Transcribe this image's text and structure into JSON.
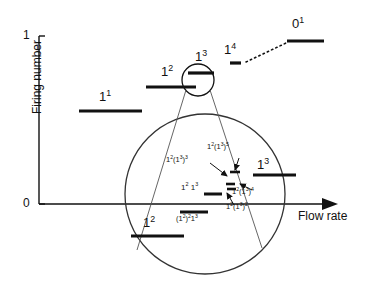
{
  "figure": {
    "type": "devil-staircase-firing-number",
    "axes": {
      "ylabel": "Firing number",
      "xlabel": "Flow rate",
      "yticks": [
        "0",
        "1"
      ],
      "ylim": [
        0,
        1
      ],
      "xticks": [],
      "grid": false
    },
    "plateaus": [
      {
        "label_html": "1<sup>1</sup>",
        "name": "plateau-1-1"
      },
      {
        "label_html": "1<sup>2</sup>",
        "name": "plateau-1-2-upper"
      },
      {
        "label_html": "1<sup>3</sup>",
        "name": "plateau-1-3-upper"
      },
      {
        "label_html": "1<sup>4</sup>",
        "name": "plateau-1-4"
      },
      {
        "label_html": "0<sup>1</sup>",
        "name": "plateau-0-1"
      },
      {
        "label_html": "1<sup>2</sup>",
        "name": "plateau-1-2-lower"
      }
    ],
    "magnified": {
      "label_1_3": "1<sup>3</sup>",
      "label_12_13": "1<sup>2</sup> 1<sup>3</sup>",
      "label_12_13_3": "1<sup>2</sup>(1<sup>3</sup>)<sup>3</sup>",
      "label_12_13_5": "1<sup>2</sup>(1<sup>3</sup>)<sup>5</sup>",
      "label_12_13_4": "1<sup>2</sup>(1<sup>3</sup>)<sup>4</sup>",
      "label_12_13_2": "1<sup>2</sup>(1<sup>3</sup>)<sup>2</sup>",
      "label_12_2_13": "(1<sup>2</sup>)<sup>2</sup>1<sup>3</sup>"
    },
    "colors": {
      "ink": "#111111",
      "curve": "#333333",
      "thin": "#555555"
    }
  },
  "chart_data": {
    "type": "line",
    "title": "",
    "xlabel": "Flow rate",
    "ylabel": "Firing number",
    "ylim": [
      0,
      1
    ],
    "tick_labels_y": [
      "0",
      "1"
    ],
    "steps": [
      {
        "symbol": "1^1",
        "firing_number": 0.5
      },
      {
        "symbol": "1^2",
        "firing_number": 0.665
      },
      {
        "symbol": "1^3",
        "firing_number": 0.735
      },
      {
        "symbol": "1^4",
        "firing_number": 0.76
      },
      {
        "symbol": "0^1",
        "firing_number": 0.86
      },
      {
        "symbol": "1^2",
        "firing_number": 0.11
      }
    ],
    "inset_steps": [
      "1^2(1^3)^3",
      "1^2(1^3)^5",
      "1^3",
      "1^2 1^3",
      "1^2(1^3)^4",
      "1^2(1^3)^2",
      "(1^2)^2 1^3"
    ]
  }
}
